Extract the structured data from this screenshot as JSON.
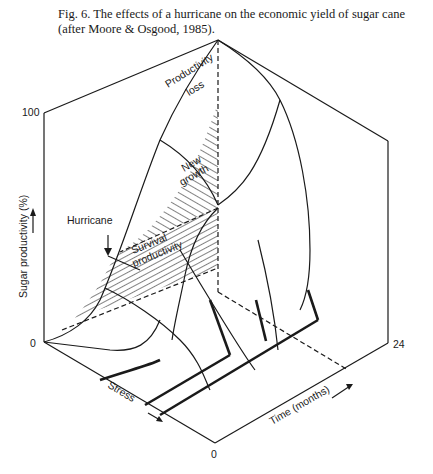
{
  "caption": "Fig. 6. The effects of a hurricane on the economic yield of sugar cane (after Moore & Osgood, 1985).",
  "axes": {
    "vertical": {
      "label": "Sugar productivity (%)",
      "ticks": [
        "0",
        "100"
      ]
    },
    "stress": {
      "label": "Stress"
    },
    "time": {
      "label": "Time (months)",
      "ticks": [
        "0",
        "24"
      ]
    }
  },
  "regions": {
    "productivity_loss": [
      "Productivity",
      "loss"
    ],
    "new_growth": [
      "New",
      "growth"
    ],
    "survival_productivity": [
      "Survival",
      "productivity"
    ]
  },
  "annotations": {
    "hurricane": "Hurricane"
  },
  "colors": {
    "ink": "#1a1a1a",
    "background": "#ffffff"
  }
}
